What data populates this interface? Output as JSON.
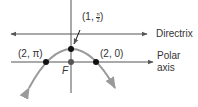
{
  "diagram": {
    "type": "parabola-polar",
    "labels": {
      "vertex_point": {
        "prefix": "(1, ",
        "num": "π",
        "den": "2",
        "suffix": ")"
      },
      "left_point": "(2, π)",
      "right_point": "(2, 0)",
      "focus": "F",
      "directrix": "Directrix",
      "polar_axis_line1": "Polar",
      "polar_axis_line2": "axis"
    },
    "points": [
      {
        "name": "vertex",
        "polar": "(1, π/2)"
      },
      {
        "name": "left",
        "polar": "(2, π)"
      },
      {
        "name": "right",
        "polar": "(2, 0)"
      },
      {
        "name": "focus",
        "label": "F"
      }
    ],
    "colors": {
      "line": "#555555",
      "curve": "#9a9a9a",
      "dot": "#111111",
      "focus_dot": "#555555",
      "text": "#333333"
    }
  }
}
